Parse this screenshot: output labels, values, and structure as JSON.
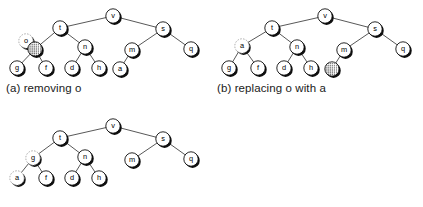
{
  "figure": {
    "background_color": "#ffffff",
    "node_fill": "#ffffff",
    "node_stroke": "#000000",
    "node_shadow": "#101010",
    "edge_color": "#3a3a3a",
    "ghost_stroke": "#9a9a9a",
    "stipple_color": "#2b2b2b"
  },
  "panels": [
    {
      "id": "panel-a",
      "caption": "(a) removing o",
      "nodes": [
        {
          "id": "v",
          "label": "v",
          "x": 111,
          "y": 14,
          "style": "normal"
        },
        {
          "id": "t",
          "label": "t",
          "x": 58,
          "y": 26,
          "style": "normal"
        },
        {
          "id": "s",
          "label": "s",
          "x": 161,
          "y": 27,
          "style": "normal"
        },
        {
          "id": "o",
          "label": "o",
          "x": 24,
          "y": 39,
          "style": "ghost"
        },
        {
          "id": "removed",
          "label": "",
          "x": 33,
          "y": 47,
          "style": "stippled"
        },
        {
          "id": "n",
          "label": "n",
          "x": 83,
          "y": 45,
          "style": "normal"
        },
        {
          "id": "m",
          "label": "m",
          "x": 130,
          "y": 48,
          "style": "normal"
        },
        {
          "id": "q",
          "label": "q",
          "x": 189,
          "y": 47,
          "style": "normal"
        },
        {
          "id": "g",
          "label": "g",
          "x": 15,
          "y": 66,
          "style": "normal"
        },
        {
          "id": "f",
          "label": "f",
          "x": 44,
          "y": 66,
          "style": "normal"
        },
        {
          "id": "d",
          "label": "d",
          "x": 70,
          "y": 66,
          "style": "normal"
        },
        {
          "id": "h",
          "label": "h",
          "x": 97,
          "y": 66,
          "style": "normal"
        },
        {
          "id": "a",
          "label": "a",
          "x": 118,
          "y": 67,
          "style": "normal"
        }
      ],
      "edges": [
        {
          "from": "v",
          "to": "t"
        },
        {
          "from": "v",
          "to": "s"
        },
        {
          "from": "t",
          "to": "removed"
        },
        {
          "from": "t",
          "to": "n"
        },
        {
          "from": "removed",
          "to": "g"
        },
        {
          "from": "removed",
          "to": "f"
        },
        {
          "from": "n",
          "to": "d"
        },
        {
          "from": "n",
          "to": "h"
        },
        {
          "from": "s",
          "to": "m"
        },
        {
          "from": "s",
          "to": "q"
        },
        {
          "from": "m",
          "to": "a"
        }
      ]
    },
    {
      "id": "panel-b",
      "caption": "(b) replacing o with a",
      "nodes": [
        {
          "id": "v",
          "label": "v",
          "x": 111,
          "y": 14,
          "style": "normal"
        },
        {
          "id": "t",
          "label": "t",
          "x": 58,
          "y": 26,
          "style": "normal"
        },
        {
          "id": "s",
          "label": "s",
          "x": 161,
          "y": 27,
          "style": "normal"
        },
        {
          "id": "a",
          "label": "a",
          "x": 28,
          "y": 44,
          "style": "ghost"
        },
        {
          "id": "n",
          "label": "n",
          "x": 83,
          "y": 45,
          "style": "normal"
        },
        {
          "id": "m",
          "label": "m",
          "x": 130,
          "y": 48,
          "style": "normal"
        },
        {
          "id": "q",
          "label": "q",
          "x": 189,
          "y": 47,
          "style": "normal"
        },
        {
          "id": "g",
          "label": "g",
          "x": 15,
          "y": 66,
          "style": "normal"
        },
        {
          "id": "f",
          "label": "f",
          "x": 44,
          "y": 66,
          "style": "normal"
        },
        {
          "id": "d",
          "label": "d",
          "x": 70,
          "y": 66,
          "style": "normal"
        },
        {
          "id": "h",
          "label": "h",
          "x": 97,
          "y": 66,
          "style": "normal"
        },
        {
          "id": "vacated",
          "label": "",
          "x": 118,
          "y": 67,
          "style": "stippled"
        }
      ],
      "edges": [
        {
          "from": "v",
          "to": "t"
        },
        {
          "from": "v",
          "to": "s"
        },
        {
          "from": "t",
          "to": "a"
        },
        {
          "from": "t",
          "to": "n"
        },
        {
          "from": "a",
          "to": "g"
        },
        {
          "from": "a",
          "to": "f"
        },
        {
          "from": "n",
          "to": "d"
        },
        {
          "from": "n",
          "to": "h"
        },
        {
          "from": "s",
          "to": "m"
        },
        {
          "from": "s",
          "to": "q"
        },
        {
          "from": "m",
          "to": "vacated"
        }
      ]
    },
    {
      "id": "panel-c",
      "caption": "",
      "nodes": [
        {
          "id": "v",
          "label": "v",
          "x": 111,
          "y": 14,
          "style": "normal"
        },
        {
          "id": "t",
          "label": "t",
          "x": 58,
          "y": 26,
          "style": "normal"
        },
        {
          "id": "s",
          "label": "s",
          "x": 161,
          "y": 27,
          "style": "normal"
        },
        {
          "id": "g",
          "label": "g",
          "x": 31,
          "y": 46,
          "style": "ghost"
        },
        {
          "id": "n",
          "label": "n",
          "x": 83,
          "y": 45,
          "style": "normal"
        },
        {
          "id": "m",
          "label": "m",
          "x": 130,
          "y": 48,
          "style": "normal"
        },
        {
          "id": "q",
          "label": "q",
          "x": 189,
          "y": 47,
          "style": "normal"
        },
        {
          "id": "a",
          "label": "a",
          "x": 15,
          "y": 66,
          "style": "ghost"
        },
        {
          "id": "f",
          "label": "f",
          "x": 44,
          "y": 66,
          "style": "normal"
        },
        {
          "id": "d",
          "label": "d",
          "x": 70,
          "y": 66,
          "style": "normal"
        },
        {
          "id": "h",
          "label": "h",
          "x": 97,
          "y": 66,
          "style": "normal"
        }
      ],
      "edges": [
        {
          "from": "v",
          "to": "t"
        },
        {
          "from": "v",
          "to": "s"
        },
        {
          "from": "t",
          "to": "g"
        },
        {
          "from": "t",
          "to": "n"
        },
        {
          "from": "g",
          "to": "a"
        },
        {
          "from": "g",
          "to": "f"
        },
        {
          "from": "n",
          "to": "d"
        },
        {
          "from": "n",
          "to": "h"
        },
        {
          "from": "s",
          "to": "m"
        },
        {
          "from": "s",
          "to": "q"
        }
      ]
    }
  ],
  "layout": {
    "panel_a_origin": {
      "x": 2,
      "y": 2
    },
    "panel_b_origin": {
      "x": 214,
      "y": 2
    },
    "panel_c_origin": {
      "x": 2,
      "y": 112
    },
    "caption_a_pos": {
      "x": 6,
      "y": 82
    },
    "caption_b_pos": {
      "x": 217,
      "y": 82
    },
    "node_radius": 7.2
  }
}
